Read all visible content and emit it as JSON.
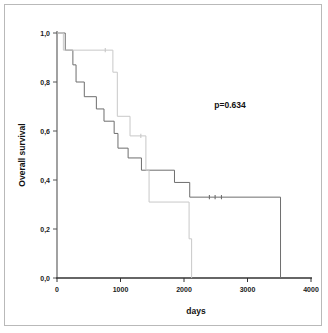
{
  "figure": {
    "annotation": "p=0.634",
    "xlabel": "days",
    "ylabel": "Overall survival"
  },
  "chart_data": {
    "type": "line",
    "title": "",
    "xlabel": "days",
    "ylabel": "Overall survival",
    "xlim": [
      0,
      4000
    ],
    "ylim": [
      0.0,
      1.0
    ],
    "xticks": [
      0,
      1000,
      2000,
      3000,
      4000
    ],
    "xtick_labels": [
      "0",
      "1000",
      "2000",
      "3000",
      "4000"
    ],
    "yticks": [
      0.0,
      0.2,
      0.4,
      0.6,
      0.8,
      1.0
    ],
    "ytick_labels": [
      "0,0",
      "0,2",
      "0,4",
      "0,6",
      "0,8",
      "1,0"
    ],
    "grid": false,
    "legend": "none",
    "annotations": [
      {
        "text": "p=0.634",
        "x": 2600,
        "y": 0.72
      }
    ],
    "series": [
      {
        "name": "group-1",
        "color": "#6e6e6e",
        "style": "step-post",
        "points": [
          {
            "x": 0,
            "y": 1.0
          },
          {
            "x": 130,
            "y": 1.0
          },
          {
            "x": 130,
            "y": 0.93
          },
          {
            "x": 250,
            "y": 0.93
          },
          {
            "x": 250,
            "y": 0.87
          },
          {
            "x": 300,
            "y": 0.87
          },
          {
            "x": 300,
            "y": 0.8
          },
          {
            "x": 430,
            "y": 0.8
          },
          {
            "x": 430,
            "y": 0.74
          },
          {
            "x": 620,
            "y": 0.74
          },
          {
            "x": 620,
            "y": 0.69
          },
          {
            "x": 740,
            "y": 0.69
          },
          {
            "x": 740,
            "y": 0.64
          },
          {
            "x": 900,
            "y": 0.64
          },
          {
            "x": 900,
            "y": 0.59
          },
          {
            "x": 960,
            "y": 0.59
          },
          {
            "x": 960,
            "y": 0.53
          },
          {
            "x": 1120,
            "y": 0.53
          },
          {
            "x": 1120,
            "y": 0.49
          },
          {
            "x": 1330,
            "y": 0.49
          },
          {
            "x": 1330,
            "y": 0.44
          },
          {
            "x": 1850,
            "y": 0.44
          },
          {
            "x": 1850,
            "y": 0.39
          },
          {
            "x": 2090,
            "y": 0.39
          },
          {
            "x": 2090,
            "y": 0.33
          },
          {
            "x": 3520,
            "y": 0.33
          },
          {
            "x": 3520,
            "y": 0.0
          }
        ],
        "censored": [
          {
            "x": 2400,
            "y": 0.33
          },
          {
            "x": 2490,
            "y": 0.33
          },
          {
            "x": 2590,
            "y": 0.33
          }
        ]
      },
      {
        "name": "group-2",
        "color": "#c8c8c8",
        "style": "step-post",
        "points": [
          {
            "x": 0,
            "y": 1.0
          },
          {
            "x": 100,
            "y": 1.0
          },
          {
            "x": 100,
            "y": 0.93
          },
          {
            "x": 880,
            "y": 0.93
          },
          {
            "x": 880,
            "y": 0.84
          },
          {
            "x": 950,
            "y": 0.84
          },
          {
            "x": 950,
            "y": 0.66
          },
          {
            "x": 1150,
            "y": 0.66
          },
          {
            "x": 1150,
            "y": 0.58
          },
          {
            "x": 1400,
            "y": 0.58
          },
          {
            "x": 1400,
            "y": 0.44
          },
          {
            "x": 1450,
            "y": 0.44
          },
          {
            "x": 1450,
            "y": 0.31
          },
          {
            "x": 2080,
            "y": 0.31
          },
          {
            "x": 2080,
            "y": 0.16
          },
          {
            "x": 2120,
            "y": 0.16
          },
          {
            "x": 2120,
            "y": 0.0
          }
        ],
        "censored": [
          {
            "x": 760,
            "y": 0.93
          },
          {
            "x": 1320,
            "y": 0.58
          }
        ]
      }
    ]
  }
}
